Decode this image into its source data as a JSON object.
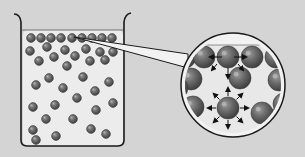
{
  "diagram": {
    "colors": {
      "background": "#d4d4d4",
      "liquid": "#ececec",
      "outline": "#1a1a1a",
      "molecule": "#6a6a6a",
      "molecule_highlight": "#a8a8a8",
      "arrow": "#111111",
      "surface_line": "#777777"
    },
    "beaker": {
      "label": "beaker",
      "surface_molecule_count": 9,
      "interior_molecule_count": 33
    },
    "magnified_view": {
      "label": "magnified view",
      "surface_molecule_forces": [
        "left",
        "right",
        "down"
      ],
      "interior_molecule_forces": [
        "up",
        "down",
        "left",
        "right",
        "up-left",
        "up-right",
        "down-left",
        "down-right"
      ]
    }
  }
}
